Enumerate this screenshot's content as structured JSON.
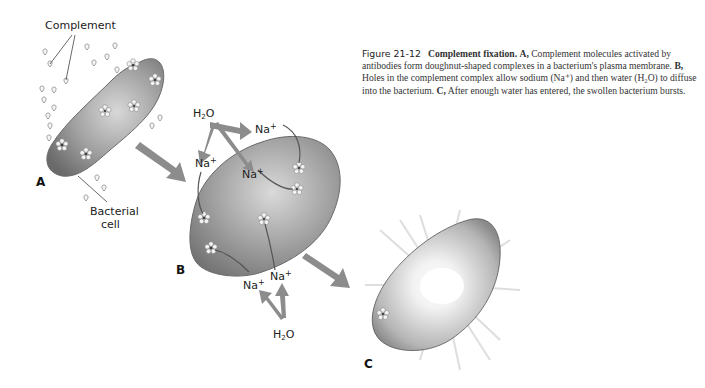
{
  "figure": {
    "number": "Figure 21-12",
    "title": "Complement fixation.",
    "caption_parts": [
      {
        "letter": "A,",
        "text": " Complement molecules activated by antibodies form doughnut-shaped complexes in a bacterium's plasma membrane. "
      },
      {
        "letter": "B,",
        "text": " Holes in the complement complex allow sodium (Na⁺) and then water (H₂O) to diffuse into the bacterium. "
      },
      {
        "letter": "C,",
        "text": " After enough water has entered, the swollen bacterium bursts."
      }
    ]
  },
  "panels": {
    "a": {
      "letter": "A",
      "labels": {
        "complement": "Complement",
        "bacterial": "Bacterial",
        "cell": "cell"
      }
    },
    "b": {
      "letter": "B",
      "labels": {
        "h2o_top_main": "H",
        "h2o_top_sub": "2",
        "h2o_top_end": "O",
        "na_top_right": "Na",
        "na_left": "Na",
        "na_center": "Na",
        "na_bottom_right": "Na",
        "na_bottom_left": "Na",
        "plus": "+",
        "h2o_bottom_main": "H",
        "h2o_bottom_sub": "2",
        "h2o_bottom_end": "O"
      }
    },
    "c": {
      "letter": "C"
    }
  },
  "colors": {
    "cell_dark": "#6e6e6e",
    "cell_light": "#cfcfcf",
    "arrow": "#8c8c8c",
    "text": "#222222"
  }
}
